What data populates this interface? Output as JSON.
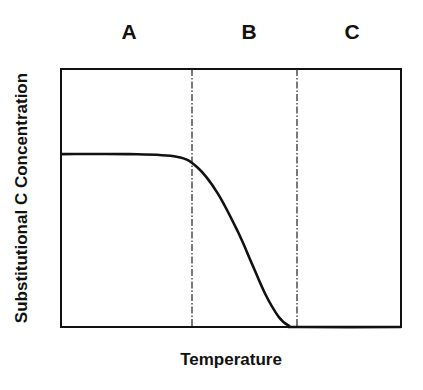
{
  "chart_data": {
    "type": "line",
    "title": "",
    "xlabel": "Temperature",
    "ylabel": "Substitutional C Concentration",
    "regions": [
      {
        "label": "A",
        "x_start": 0.0,
        "x_end": 0.38
      },
      {
        "label": "B",
        "x_start": 0.38,
        "x_end": 0.69
      },
      {
        "label": "C",
        "x_start": 0.69,
        "x_end": 1.0
      }
    ],
    "region_boundaries": [
      0.38,
      0.69
    ],
    "boundary_style": "dash-dot",
    "series": [
      {
        "name": "Substitutional C Concentration",
        "x": [
          0.0,
          0.2,
          0.34,
          0.4,
          0.46,
          0.52,
          0.56,
          0.6,
          0.64,
          0.67,
          0.7,
          1.0
        ],
        "y": [
          0.67,
          0.67,
          0.66,
          0.62,
          0.52,
          0.37,
          0.25,
          0.13,
          0.04,
          0.005,
          0.0,
          0.0
        ]
      }
    ],
    "xlim": [
      0,
      1
    ],
    "ylim": [
      0,
      1
    ],
    "ticks": "none",
    "grid": false,
    "legend": "none"
  },
  "labels": {
    "region_a": "A",
    "region_b": "B",
    "region_c": "C",
    "x_axis": "Temperature",
    "y_axis": "Substitutional C Concentration"
  }
}
